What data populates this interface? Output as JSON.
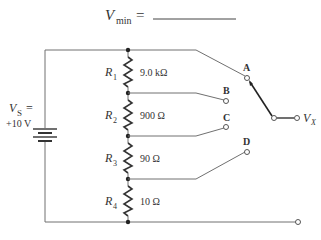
{
  "header": {
    "symbol": "V",
    "subscript": "min",
    "equals": "="
  },
  "source": {
    "symbol": "V",
    "subscript": "S",
    "equals": "=",
    "value": "+10 V"
  },
  "resistors": [
    {
      "name": "R",
      "index": "1",
      "value": "9.0 kΩ"
    },
    {
      "name": "R",
      "index": "2",
      "value": "900 Ω"
    },
    {
      "name": "R",
      "index": "3",
      "value": "90 Ω"
    },
    {
      "name": "R",
      "index": "4",
      "value": "10 Ω"
    }
  ],
  "switch": {
    "positions": [
      "A",
      "B",
      "C",
      "D"
    ],
    "selected": "A",
    "output_symbol": "V",
    "output_subscript": "X"
  }
}
